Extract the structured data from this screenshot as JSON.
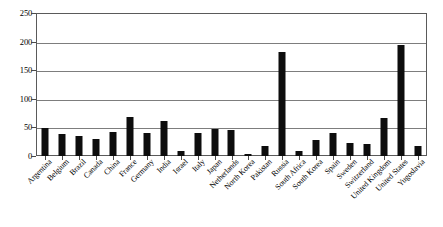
{
  "chart_data": {
    "type": "bar",
    "title": "",
    "subtitle": "",
    "xlabel": "",
    "ylabel": "",
    "ylim": [
      0,
      250
    ],
    "yticks": [
      0,
      50,
      100,
      150,
      200,
      250
    ],
    "ytick_labels": [
      "0",
      "50",
      "100",
      "150",
      "200",
      "250"
    ],
    "grid": true,
    "grid_axis": "y",
    "legend": false,
    "legend_position": "none",
    "bar_color": "#0d0d0d",
    "categories": [
      "Argentina",
      "Belgium",
      "Brazil",
      "Canada",
      "China",
      "France",
      "Germany",
      "India",
      "Israel",
      "Italy",
      "Japan",
      "Netherlands",
      "North Korea",
      "Pakistan",
      "Russia",
      "South Africa",
      "South Korea",
      "Spain",
      "Sweden",
      "Switzerland",
      "United Kingdom",
      "United States",
      "Yugoslavia"
    ],
    "values": [
      50,
      38,
      36,
      30,
      42,
      68,
      40,
      62,
      8,
      40,
      48,
      46,
      4,
      17,
      183,
      9,
      28,
      40,
      23,
      22,
      67,
      196,
      17
    ]
  }
}
